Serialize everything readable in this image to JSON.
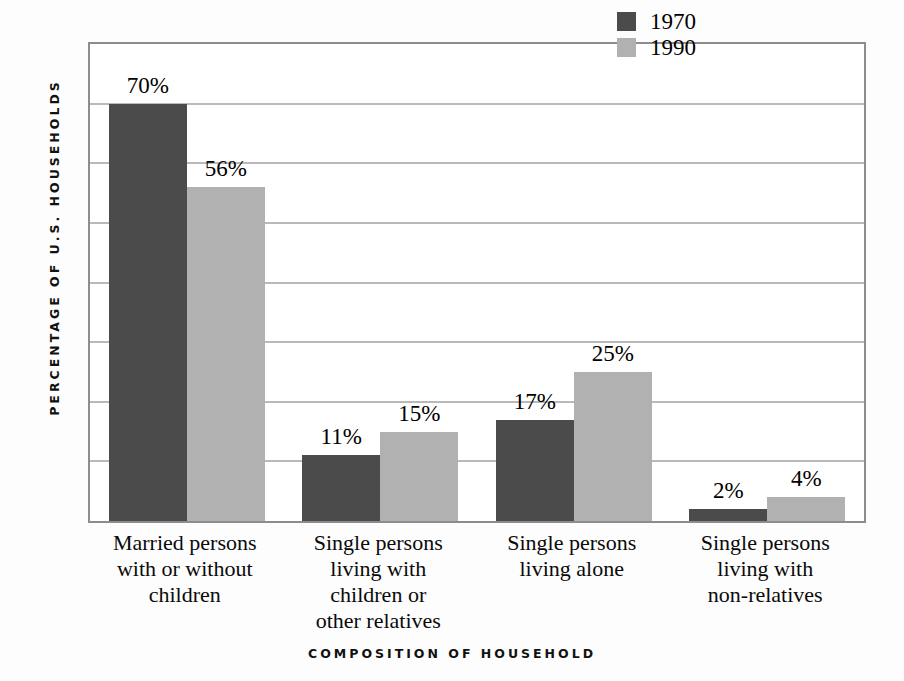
{
  "chart_data": {
    "type": "bar",
    "title": "",
    "xlabel": "COMPOSITION OF HOUSEHOLD",
    "ylabel": "PERCENTAGE OF U.S. HOUSEHOLDS",
    "ylim": [
      0,
      80
    ],
    "ytick_interval": 10,
    "grid": true,
    "legend_position": "top-right",
    "categories": [
      "Married persons with or without children",
      "Single persons living with children or other relatives",
      "Single persons living alone",
      "Single persons living with non-relatives"
    ],
    "category_lines": [
      [
        "Married persons",
        "with or without",
        "children"
      ],
      [
        "Single persons",
        "living with",
        "children or",
        "other relatives"
      ],
      [
        "Single persons",
        "living alone"
      ],
      [
        "Single persons",
        "living with",
        "non-relatives"
      ]
    ],
    "series": [
      {
        "name": "1970",
        "color": "#4b4b4b",
        "values": [
          70,
          11,
          17,
          2
        ],
        "value_labels": [
          "70%",
          "11%",
          "17%",
          "2%"
        ]
      },
      {
        "name": "1990",
        "color": "#b1b1b1",
        "values": [
          56,
          15,
          25,
          4
        ],
        "value_labels": [
          "56%",
          "15%",
          "25%",
          "4%"
        ]
      }
    ]
  },
  "legend": {
    "items": [
      {
        "label": "1970",
        "swatch": "s1970"
      },
      {
        "label": "1990",
        "swatch": "s1990"
      }
    ]
  },
  "axes": {
    "x_title": "COMPOSITION OF HOUSEHOLD",
    "y_title": "PERCENTAGE OF U.S. HOUSEHOLDS"
  }
}
